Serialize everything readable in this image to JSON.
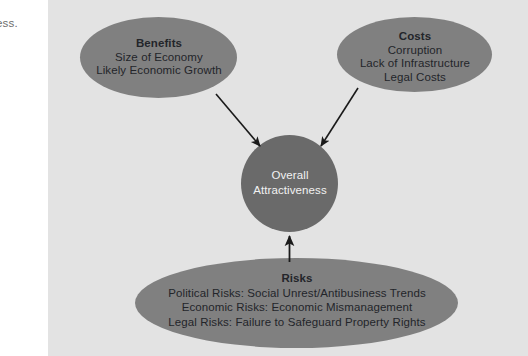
{
  "figure": {
    "margin_text_fragment": "ess.",
    "panel_color": "#e3e3e3",
    "page_background": "#ffffff"
  },
  "diagram": {
    "type": "influence-diagram",
    "node_fill": "#808080",
    "center_fill": "#6a6a6a",
    "arrow_color": "#1a1a1a",
    "nodes": [
      {
        "id": "benefits",
        "shape": "ellipse",
        "title": "Benefits",
        "lines": [
          "Size of Economy",
          "Likely Economic Growth"
        ],
        "text_color": "#23252a"
      },
      {
        "id": "costs",
        "shape": "ellipse",
        "title": "Costs",
        "lines": [
          "Corruption",
          "Lack of Infrastructure",
          "Legal Costs"
        ],
        "text_color": "#23252a"
      },
      {
        "id": "overall-attractiveness",
        "shape": "circle",
        "title": "",
        "lines": [
          "Overall",
          "Attractiveness"
        ],
        "text_color": "#f2f2f2"
      },
      {
        "id": "risks",
        "shape": "ellipse",
        "title": "Risks",
        "lines": [
          "Political Risks: Social Unrest/Antibusiness Trends",
          "Economic Risks: Economic Mismanagement",
          "Legal Risks: Failure to Safeguard Property Rights"
        ],
        "text_color": "#23252a"
      }
    ],
    "edges": [
      {
        "id": "benefits-to-center",
        "from": "benefits",
        "to": "overall-attractiveness",
        "arrowhead": "end"
      },
      {
        "id": "costs-to-center",
        "from": "costs",
        "to": "overall-attractiveness",
        "arrowhead": "end"
      },
      {
        "id": "risks-to-center",
        "from": "risks",
        "to": "overall-attractiveness",
        "arrowhead": "end"
      }
    ]
  }
}
